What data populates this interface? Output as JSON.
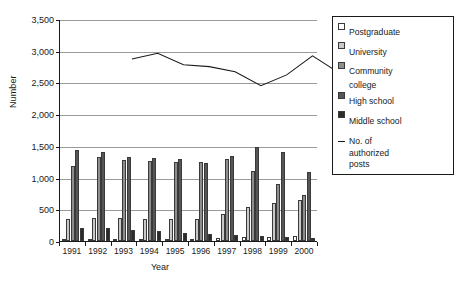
{
  "chart_data": {
    "type": "bar",
    "title": "",
    "xlabel": "Year",
    "ylabel": "Number",
    "categories": [
      "1991",
      "1992",
      "1993",
      "1994",
      "1995",
      "1996",
      "1997",
      "1998",
      "1999",
      "2000"
    ],
    "ylim": [
      0,
      3500
    ],
    "ytick_labels": [
      "0",
      "500",
      "1,000",
      "1,500",
      "2,000",
      "2,500",
      "3,000",
      "3,500"
    ],
    "ytick_values": [
      0,
      500,
      1000,
      1500,
      2000,
      2500,
      3000,
      3500
    ],
    "grid": true,
    "legend_position": "right",
    "series": [
      {
        "name": "Postgraduate",
        "type": "bar",
        "color": "#ffffff",
        "values": [
          0,
          0,
          0,
          0,
          20,
          30,
          40,
          60,
          70,
          80
        ]
      },
      {
        "name": "University",
        "type": "bar",
        "color": "#c9c9c9",
        "values": [
          350,
          360,
          355,
          350,
          350,
          350,
          420,
          540,
          600,
          640
        ]
      },
      {
        "name": "Community college",
        "type": "bar",
        "color": "#8e8e8e",
        "values": [
          1180,
          1320,
          1280,
          1260,
          1250,
          1240,
          1300,
          1100,
          900,
          720
        ]
      },
      {
        "name": "High school",
        "type": "bar",
        "color": "#565656",
        "values": [
          1440,
          1400,
          1330,
          1310,
          1290,
          1230,
          1340,
          1490,
          1400,
          1090
        ]
      },
      {
        "name": "Middle school",
        "type": "bar",
        "color": "#2b2b2b",
        "values": [
          210,
          200,
          180,
          160,
          130,
          110,
          100,
          80,
          60,
          50
        ]
      },
      {
        "name": "No. of authorized posts",
        "type": "line",
        "color": "#1a1a1a",
        "values": [
          3200,
          3290,
          3110,
          3080,
          3000,
          2780,
          2950,
          3250,
          2990,
          2340
        ]
      }
    ]
  },
  "legend": {
    "items": [
      {
        "label": "Postgraduate",
        "color": "#ffffff",
        "kind": "swatch"
      },
      {
        "label": "University",
        "color": "#c9c9c9",
        "kind": "swatch"
      },
      {
        "label": "Community",
        "label2": "college",
        "color": "#8e8e8e",
        "kind": "swatch"
      },
      {
        "label": "High school",
        "color": "#565656",
        "kind": "swatch"
      },
      {
        "label": "Middle school",
        "color": "#2b2b2b",
        "kind": "swatch"
      }
    ],
    "line_item": {
      "label": "No. of",
      "label2": "authorized",
      "label3": "posts",
      "color": "#1a1a1a",
      "kind": "line"
    }
  }
}
